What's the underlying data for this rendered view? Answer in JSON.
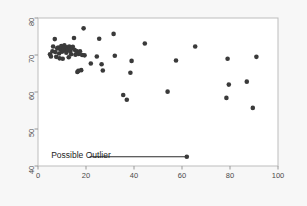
{
  "chart_data": {
    "type": "scatter",
    "title": "",
    "xlabel": "",
    "ylabel": "",
    "xlim": [
      0,
      100
    ],
    "ylim": [
      40,
      80
    ],
    "xticks": [
      0,
      20,
      40,
      60,
      80,
      100
    ],
    "yticks": [
      40,
      50,
      60,
      70,
      80
    ],
    "xtick_labels": [
      "0",
      "20",
      "40",
      "60",
      "80",
      "100"
    ],
    "ytick_labels": [
      "40",
      "50",
      "60",
      "70",
      "80"
    ],
    "grid": false,
    "legend": null,
    "marker": {
      "shape": "circle",
      "color": "#3a3a3a",
      "size_px": 4.6
    },
    "annotations": [
      {
        "text": "Possible Outlier",
        "text_x": 5.5,
        "text_y": 42.6,
        "leader_line": {
          "from_x": 21.5,
          "from_y": 42.5,
          "to_x": 61.8,
          "to_y": 42.5
        },
        "points_to": {
          "x": 62.0,
          "y": 42.5
        }
      }
    ],
    "points": [
      {
        "x": 5.0,
        "y": 70.2
      },
      {
        "x": 5.4,
        "y": 69.6
      },
      {
        "x": 6.0,
        "y": 71.0
      },
      {
        "x": 6.3,
        "y": 72.3
      },
      {
        "x": 7.0,
        "y": 74.3
      },
      {
        "x": 7.2,
        "y": 70.8
      },
      {
        "x": 7.6,
        "y": 69.5
      },
      {
        "x": 8.0,
        "y": 71.8
      },
      {
        "x": 8.4,
        "y": 72.0
      },
      {
        "x": 8.8,
        "y": 70.4
      },
      {
        "x": 9.0,
        "y": 69.1
      },
      {
        "x": 9.3,
        "y": 71.5
      },
      {
        "x": 9.7,
        "y": 72.4
      },
      {
        "x": 10.0,
        "y": 70.9
      },
      {
        "x": 10.3,
        "y": 69.0
      },
      {
        "x": 10.6,
        "y": 71.9
      },
      {
        "x": 11.0,
        "y": 72.6
      },
      {
        "x": 11.4,
        "y": 71.2
      },
      {
        "x": 11.8,
        "y": 70.6
      },
      {
        "x": 12.0,
        "y": 72.1
      },
      {
        "x": 12.4,
        "y": 71.6
      },
      {
        "x": 12.8,
        "y": 69.4
      },
      {
        "x": 13.0,
        "y": 72.3
      },
      {
        "x": 13.4,
        "y": 71.0
      },
      {
        "x": 13.8,
        "y": 70.2
      },
      {
        "x": 14.0,
        "y": 71.8
      },
      {
        "x": 14.5,
        "y": 72.2
      },
      {
        "x": 15.0,
        "y": 74.6
      },
      {
        "x": 15.2,
        "y": 71.4
      },
      {
        "x": 15.6,
        "y": 70.1
      },
      {
        "x": 16.0,
        "y": 71.1
      },
      {
        "x": 16.4,
        "y": 65.4
      },
      {
        "x": 16.8,
        "y": 65.7
      },
      {
        "x": 17.0,
        "y": 70.3
      },
      {
        "x": 17.5,
        "y": 71.0
      },
      {
        "x": 18.0,
        "y": 65.9
      },
      {
        "x": 18.4,
        "y": 70.0
      },
      {
        "x": 19.0,
        "y": 77.2
      },
      {
        "x": 19.4,
        "y": 69.9
      },
      {
        "x": 22.0,
        "y": 67.7
      },
      {
        "x": 24.5,
        "y": 69.6
      },
      {
        "x": 25.5,
        "y": 74.4
      },
      {
        "x": 26.5,
        "y": 67.5
      },
      {
        "x": 27.0,
        "y": 65.8
      },
      {
        "x": 31.5,
        "y": 75.7
      },
      {
        "x": 32.0,
        "y": 69.8
      },
      {
        "x": 35.5,
        "y": 59.2
      },
      {
        "x": 37.0,
        "y": 57.9
      },
      {
        "x": 38.5,
        "y": 65.2
      },
      {
        "x": 39.0,
        "y": 68.4
      },
      {
        "x": 44.5,
        "y": 73.1
      },
      {
        "x": 54.0,
        "y": 60.1
      },
      {
        "x": 57.5,
        "y": 68.5
      },
      {
        "x": 62.0,
        "y": 42.5
      },
      {
        "x": 65.5,
        "y": 72.3
      },
      {
        "x": 78.5,
        "y": 58.4
      },
      {
        "x": 79.0,
        "y": 69.0
      },
      {
        "x": 79.5,
        "y": 62.0
      },
      {
        "x": 87.0,
        "y": 62.8
      },
      {
        "x": 89.5,
        "y": 55.7
      },
      {
        "x": 91.0,
        "y": 69.5
      }
    ]
  },
  "figure": {
    "background_color": "#f7f7f7",
    "plot_background_color": "#ffffff",
    "frame_color": "#b9b9b9",
    "tick_color": "#999999",
    "label_color": "#4a4a4a",
    "annotation_color": "#1c1c1c"
  }
}
